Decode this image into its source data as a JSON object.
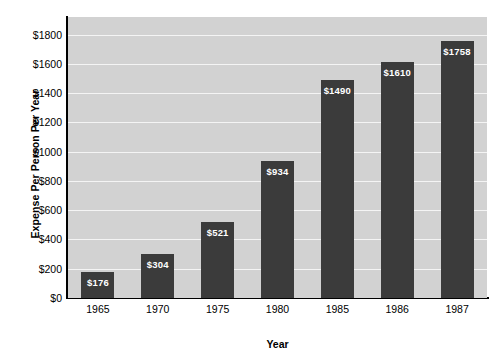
{
  "chart_data": {
    "type": "bar",
    "title": "",
    "xlabel": "Year",
    "ylabel": "Expense Per Person Per Year",
    "categories": [
      "1965",
      "1970",
      "1975",
      "1980",
      "1985",
      "1986",
      "1987"
    ],
    "values": [
      176,
      304,
      521,
      934,
      1490,
      1610,
      1758
    ],
    "value_labels": [
      "$176",
      "$304",
      "$521",
      "$934",
      "$1490",
      "$1610",
      "$1758"
    ],
    "ytick_values": [
      0,
      200,
      400,
      600,
      800,
      1000,
      1200,
      1400,
      1600,
      1800
    ],
    "ytick_labels": [
      "$0",
      "$200",
      "$400",
      "$600",
      "$800",
      "$1000",
      "$1200",
      "$1400",
      "$1600",
      "$1800"
    ],
    "ylim": [
      0,
      1920
    ],
    "xlim_categories": 7,
    "grid": true,
    "grid_axis": "y",
    "legend": "none",
    "colors": {
      "bar": "#3b3b3b",
      "plot_background": "#d2d2d2",
      "gridline": "#f4f4f4",
      "axis": "#000000",
      "figure_background": "#ffffff",
      "value_label_text": "#ffffff",
      "tick_text": "#000000"
    }
  }
}
